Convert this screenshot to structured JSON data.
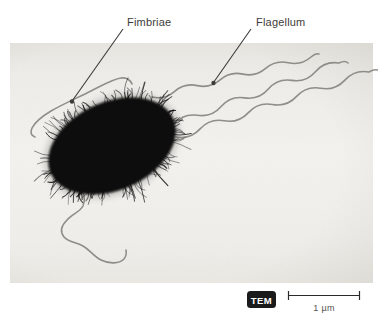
{
  "labels": {
    "fimbriae": "Fimbriae",
    "flagellum": "Flagellum"
  },
  "badge": {
    "label": "TEM"
  },
  "scale_bar": {
    "label": "1 µm"
  },
  "colors": {
    "page_bg": "#ffffff",
    "photo_top": "#e8e7e2",
    "photo_mid": "#f3f2ee",
    "photo_bottom": "#eceae6",
    "cell": "#0c0c0c",
    "flagella": "#8a8984",
    "leader": "#3c3b39",
    "label_text": "#3d3c3a",
    "badge_bg": "#1b1b1b",
    "badge_text": "#ffffff",
    "scale_text": "#55534f"
  }
}
